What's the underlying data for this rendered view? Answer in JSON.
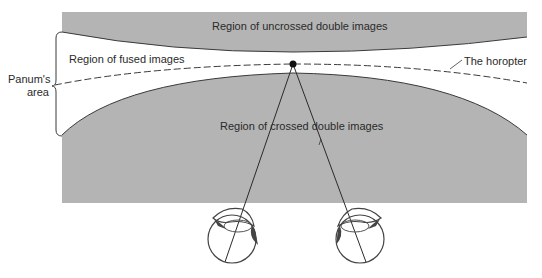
{
  "diagram": {
    "labels": {
      "uncrossed": "Region of uncrossed double images",
      "fused": "Region of fused images",
      "crossed": "Region of crossed double images",
      "horopter": "The horopter",
      "panum_line1": "Panum's",
      "panum_line2": "area"
    },
    "colors": {
      "region_fill": "#b4b4b4",
      "line": "#2a2a2a",
      "background": "#ffffff"
    },
    "elements": {
      "fixation_point": "fixation-dot",
      "eyes": [
        "left-eye",
        "right-eye"
      ]
    }
  }
}
